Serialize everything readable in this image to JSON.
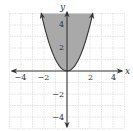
{
  "chart_data": {
    "type": "area",
    "title": "",
    "inequality": "y >= x^2",
    "boundary": {
      "equation": "y = x^2",
      "style": "solid"
    },
    "shading": "above curve",
    "xlabel": "x",
    "ylabel": "y",
    "xlim": [
      -5,
      5
    ],
    "ylim": [
      -5,
      5
    ],
    "grid": true,
    "x_tick_labels": [
      "-4",
      "-2",
      "2",
      "4"
    ],
    "y_tick_labels": [
      "4",
      "2",
      "-2",
      "-4"
    ],
    "x": [
      -2.236,
      -2,
      -1,
      0,
      1,
      2,
      2.236
    ],
    "values": [
      5,
      4,
      1,
      0,
      1,
      4,
      5
    ],
    "colors": {
      "shade": "#a9a9a9",
      "curve": "#333333",
      "grid": "#cfcfcf",
      "axis": "#333333"
    }
  },
  "labels": {
    "x_axis": "x",
    "y_axis": "y",
    "xticks": [
      {
        "value": -4,
        "text": "−4"
      },
      {
        "value": -2,
        "text": "−2"
      },
      {
        "value": 2,
        "text": "2"
      },
      {
        "value": 4,
        "text": "4"
      }
    ],
    "yticks": [
      {
        "value": 4,
        "text": "4"
      },
      {
        "value": 2,
        "text": "2"
      },
      {
        "value": -2,
        "text": "−2"
      },
      {
        "value": -4,
        "text": "−4"
      }
    ]
  }
}
